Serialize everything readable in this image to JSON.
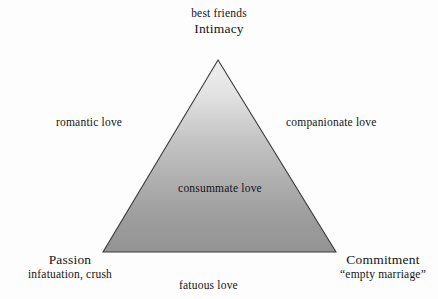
{
  "figure": {
    "background_color": "#fdfdfd",
    "triangle": {
      "fill_top_color": "#ebebeb",
      "fill_bottom_color": "#949494",
      "stroke_color": "#3a3a3a",
      "apex": {
        "x": 218,
        "y": 60
      },
      "bottom_left": {
        "x": 103,
        "y": 252
      },
      "bottom_right": {
        "x": 336,
        "y": 252
      }
    },
    "vertices": {
      "top": {
        "descriptor": "best friends",
        "component": "Intimacy"
      },
      "bottom_left": {
        "component": "Passion",
        "descriptor": "infatuation, crush"
      },
      "bottom_right": {
        "component": "Commitment",
        "descriptor": "“empty marriage”"
      }
    },
    "sides": {
      "left": "romantic love",
      "right": "companionate love",
      "bottom": "fatuous love"
    },
    "center": "consummate love"
  }
}
